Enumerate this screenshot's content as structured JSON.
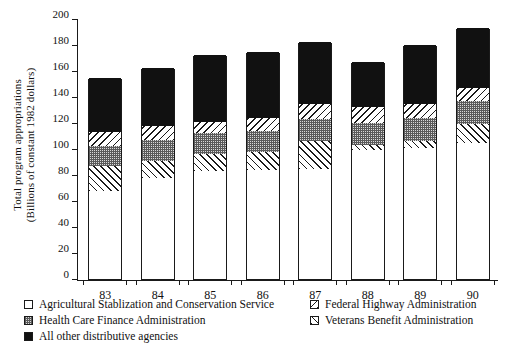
{
  "chart_data": {
    "type": "bar",
    "subtype": "stacked-bar",
    "title": "",
    "xlabel": "",
    "ylabel": "Total program appropriations (Billions of constant 1982 dollars)",
    "ylabel_lines": [
      "Total program appropriations",
      "(Billions of constant 1982 dollars)"
    ],
    "categories": [
      "83",
      "84",
      "85",
      "86",
      "87",
      "88",
      "89",
      "90"
    ],
    "ylim": [
      0,
      200
    ],
    "ytick_labels": [
      "0",
      "20",
      "40",
      "60",
      "80",
      "100",
      "120",
      "140",
      "160",
      "180",
      "200"
    ],
    "ytick_values": [
      0,
      20,
      40,
      60,
      80,
      100,
      120,
      140,
      160,
      180,
      200
    ],
    "grid": false,
    "legend_position": "below",
    "stack_order_bottom_to_top": [
      "Agricultural Stablization and Conservation Service",
      "Veterans Benefit Administration",
      "Health Care Finance Administration",
      "Federal Highway Administration",
      "All other distributive agencies"
    ],
    "series": [
      {
        "name": "Agricultural Stablization and Conservation Service",
        "pattern": "empty",
        "values": [
          68,
          78,
          83,
          84,
          85,
          99,
          101,
          105
        ]
      },
      {
        "name": "Veterans Benefit Administration",
        "pattern": "hatch-forward-slash",
        "values": [
          19,
          13,
          13,
          14,
          21,
          4,
          5,
          14
        ]
      },
      {
        "name": "Health Care Finance Administration",
        "pattern": "checkered-dots",
        "values": [
          15,
          16,
          16,
          16,
          17,
          17,
          18,
          18
        ]
      },
      {
        "name": "Federal Highway Administration",
        "pattern": "hatch-back-slash",
        "values": [
          11,
          11,
          9,
          10,
          12,
          12,
          11,
          10
        ]
      },
      {
        "name": "All other distributive agencies",
        "pattern": "solid-black",
        "values": [
          42,
          44,
          51,
          51,
          47,
          35,
          45,
          46
        ]
      }
    ],
    "totals": [
      155,
      162,
      172,
      175,
      182,
      167,
      180,
      193
    ]
  },
  "legend": {
    "left_column": [
      {
        "label": "Agricultural Stablization and Conservation Service",
        "swatch": "empty"
      },
      {
        "label": "Health Care Finance Administration",
        "swatch": "checkered-dots"
      },
      {
        "label": "All other distributive agencies",
        "swatch": "solid-black"
      }
    ],
    "right_column": [
      {
        "label": "Federal Highway Administration",
        "swatch": "hatch-back-slash"
      },
      {
        "label": "Veterans Benefit Administration",
        "swatch": "hatch-forward-slash"
      }
    ]
  },
  "colors": {
    "ink": "#1a1a1a",
    "solid_black": "#111111",
    "dots_gray": "#d9d9d9",
    "background": "#ffffff"
  }
}
